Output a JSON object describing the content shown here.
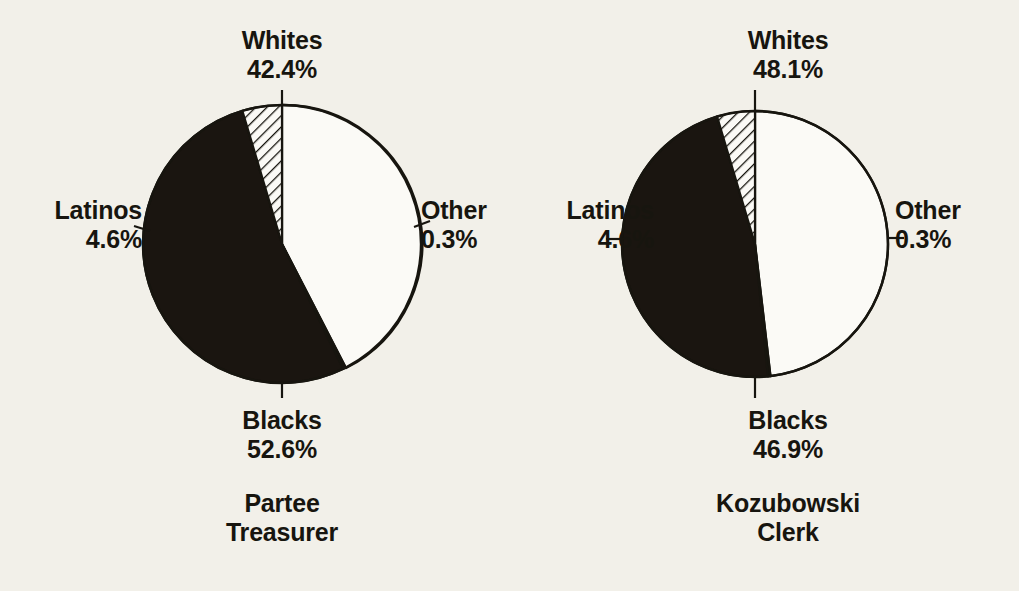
{
  "chart_data": [
    {
      "type": "pie",
      "title": "Partee Treasurer",
      "caption_line1": "Partee",
      "caption_line2": "Treasurer",
      "categories": [
        "Whites",
        "Other",
        "Blacks",
        "Latinos"
      ],
      "values": [
        42.4,
        0.3,
        52.6,
        4.6
      ],
      "labels": [
        "42.4%",
        "0.3%",
        "52.6%",
        "4.6%"
      ],
      "slice_styles": [
        "white",
        "black",
        "black",
        "hatched"
      ],
      "start_angle_deg": 0,
      "direction": "clockwise",
      "legend": "none",
      "grid": false,
      "xlabel": "",
      "ylabel": ""
    },
    {
      "type": "pie",
      "title": "Kozubowski Clerk",
      "caption_line1": "Kozubowski",
      "caption_line2": "Clerk",
      "categories": [
        "Whites",
        "Other",
        "Blacks",
        "Latinos"
      ],
      "values": [
        48.1,
        0.3,
        46.9,
        4.6
      ],
      "labels": [
        "48.1%",
        "0.3%",
        "46.9%",
        "4.6%"
      ],
      "slice_styles": [
        "white",
        "black",
        "black",
        "hatched"
      ],
      "start_angle_deg": 0,
      "direction": "clockwise",
      "legend": "none",
      "grid": false,
      "xlabel": "",
      "ylabel": ""
    }
  ],
  "colors": {
    "background": "#f2f0e9",
    "ink": "#17150f",
    "slice_white": "#fbfaf6",
    "slice_black": "#1a1510",
    "hatch_line": "#17150f"
  },
  "left_chart": {
    "whites": {
      "name": "Whites",
      "pct": "42.4%"
    },
    "blacks": {
      "name": "Blacks",
      "pct": "52.6%"
    },
    "latinos": {
      "name": "Latinos",
      "pct": "4.6%"
    },
    "other": {
      "name": "Other",
      "pct": "0.3%"
    },
    "caption1": "Partee",
    "caption2": "Treasurer"
  },
  "right_chart": {
    "whites": {
      "name": "Whites",
      "pct": "48.1%"
    },
    "blacks": {
      "name": "Blacks",
      "pct": "46.9%"
    },
    "latinos": {
      "name": "Latinos",
      "pct": "4.6%"
    },
    "other": {
      "name": "Other",
      "pct": "0.3%"
    },
    "caption1": "Kozubowski",
    "caption2": "Clerk"
  }
}
